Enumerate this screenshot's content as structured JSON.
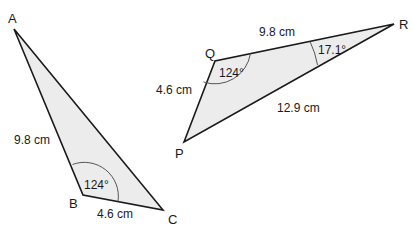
{
  "colors": {
    "fill": "#ececec",
    "stroke": "#1a1a1a",
    "arc": "#555555"
  },
  "triangles": [
    {
      "name": "ABC",
      "vertices": {
        "A": "A",
        "B": "B",
        "C": "C"
      },
      "sides": {
        "AB": "9.8 cm",
        "BC": "4.6 cm"
      },
      "angles": {
        "B": "124°"
      }
    },
    {
      "name": "PQR",
      "vertices": {
        "P": "P",
        "Q": "Q",
        "R": "R"
      },
      "sides": {
        "QR": "9.8 cm",
        "PQ": "4.6 cm",
        "PR": "12.9 cm"
      },
      "angles": {
        "Q": "124°",
        "R": "17.1°"
      }
    }
  ]
}
